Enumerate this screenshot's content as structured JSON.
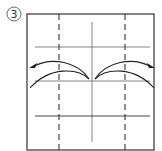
{
  "diagram": {
    "type": "origami-fold-step",
    "step_number": "3",
    "colors": {
      "line": "#333333",
      "background": "#ffffff"
    },
    "paper_frame": {
      "x": 27,
      "y": 14,
      "width": 127,
      "height": 136
    },
    "valley_fold_lines": [
      {
        "name": "left-dashed-crease",
        "x": 59
      },
      {
        "name": "right-dashed-crease",
        "x": 125
      }
    ],
    "center_crease": {
      "x": 92,
      "y1": 22,
      "y2": 142
    },
    "horizontal_creases": [
      {
        "name": "top-crease",
        "y": 47
      },
      {
        "name": "middle-crease",
        "y": 81
      },
      {
        "name": "bottom-crease",
        "y": 116
      }
    ],
    "arrows": [
      {
        "name": "left-fold-arrow",
        "direction": "left"
      },
      {
        "name": "right-fold-arrow",
        "direction": "right"
      }
    ]
  }
}
